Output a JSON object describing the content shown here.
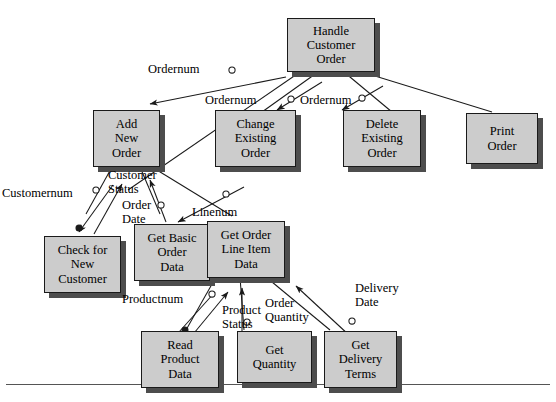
{
  "figure": {
    "type": "structure-chart",
    "colors": {
      "box_fill": "#cccccc",
      "box_border": "#1a1a1a",
      "box_shadow": "#4d4d4d",
      "line": "#1a1a1a",
      "background": "#ffffff",
      "rule": "#555555"
    }
  },
  "modules": [
    {
      "id": "handle",
      "lines": [
        "Handle",
        "Customer",
        "Order"
      ]
    },
    {
      "id": "add_new",
      "lines": [
        "Add",
        "New",
        "Order"
      ]
    },
    {
      "id": "change",
      "lines": [
        "Change",
        "Existing",
        "Order"
      ]
    },
    {
      "id": "delete",
      "lines": [
        "Delete",
        "Existing",
        "Order"
      ]
    },
    {
      "id": "print",
      "lines": [
        "Print",
        "Order"
      ]
    },
    {
      "id": "check_cust",
      "lines": [
        "Check for",
        "New",
        "Customer"
      ]
    },
    {
      "id": "get_basic",
      "lines": [
        "Get Basic",
        "Order",
        "Data"
      ]
    },
    {
      "id": "get_line_item",
      "lines": [
        "Get Order",
        "Line Item",
        "Data"
      ]
    },
    {
      "id": "read_product",
      "lines": [
        "Read",
        "Product",
        "Data"
      ]
    },
    {
      "id": "get_quantity",
      "lines": [
        "Get",
        "Quantity"
      ]
    },
    {
      "id": "get_delivery",
      "lines": [
        "Get",
        "Delivery",
        "Terms"
      ]
    }
  ],
  "couples": [
    {
      "id": "ordernum_add",
      "lines": [
        "Ordernum"
      ],
      "kind": "data",
      "direction": "down"
    },
    {
      "id": "ordernum_change",
      "lines": [
        "Ordernum"
      ],
      "kind": "data",
      "direction": "down"
    },
    {
      "id": "ordernum_delete",
      "lines": [
        "Ordernum"
      ],
      "kind": "data",
      "direction": "down"
    },
    {
      "id": "customernum",
      "lines": [
        "Customernum"
      ],
      "kind": "data",
      "direction": "down"
    },
    {
      "id": "customer_status",
      "lines": [
        "Customer",
        "Status"
      ],
      "kind": "control",
      "direction": "up"
    },
    {
      "id": "order_date",
      "lines": [
        "Order",
        "Date"
      ],
      "kind": "data",
      "direction": "up"
    },
    {
      "id": "linenum",
      "lines": [
        "Linenum"
      ],
      "kind": "data",
      "direction": "down"
    },
    {
      "id": "productnum",
      "lines": [
        "Productnum"
      ],
      "kind": "data",
      "direction": "down"
    },
    {
      "id": "product_status",
      "lines": [
        "Product",
        "Status"
      ],
      "kind": "control",
      "direction": "up"
    },
    {
      "id": "order_quantity",
      "lines": [
        "Order",
        "Quantity"
      ],
      "kind": "data",
      "direction": "up"
    },
    {
      "id": "delivery_date",
      "lines": [
        "Delivery",
        "Date"
      ],
      "kind": "data",
      "direction": "up"
    }
  ]
}
